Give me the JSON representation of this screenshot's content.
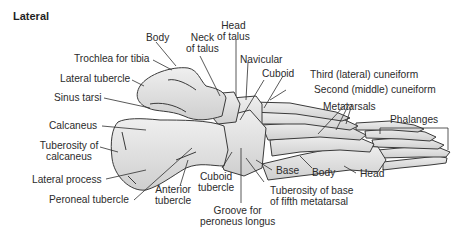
{
  "title": "Lateral",
  "labels": {
    "body_top": "Body",
    "neck_talus": [
      "Neck",
      "of talus"
    ],
    "head_talus": [
      "Head",
      "of talus"
    ],
    "trochlea": "Trochlea for tibia",
    "lateral_tubercle": "Lateral tubercle",
    "sinus_tarsi": "Sinus tarsi",
    "navicular": "Navicular",
    "cuboid": "Cuboid",
    "third_cuneiform": "Third (lateral) cuneiform",
    "second_cuneiform": "Second (middle) cuneiform",
    "metatarsals": "Metatarsals",
    "phalanges": "Phalanges",
    "calcaneus": "Calcaneus",
    "tuberosity_calcaneus": [
      "Tuberosity of",
      "calcaneus"
    ],
    "lateral_process": "Lateral process",
    "peroneal_tubercle": "Peroneal tubercle",
    "anterior_tubercle": [
      "Anterior",
      "tubercle"
    ],
    "cuboid_tubercle": [
      "Cuboid",
      "tubercle"
    ],
    "groove_peroneus": [
      "Groove for",
      "peroneus longus"
    ],
    "base": "Base",
    "body_meta": "Body",
    "head_meta": "Head",
    "tuberosity_fifth": [
      "Tuberosity of base",
      "of fifth metatarsal"
    ]
  },
  "colors": {
    "bone_fill": "#e6e6e6",
    "bone_shadow": "#c9c9c9",
    "outline": "#3a3a3a",
    "leader": "#2e2e2e"
  }
}
